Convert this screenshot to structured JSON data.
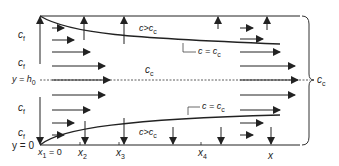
{
  "diagram": {
    "left_labels": {
      "c_f_upper_1": "c",
      "c_f_upper_1_sub": "f",
      "c_f_upper_2": "c",
      "c_f_upper_2_sub": "f",
      "y_h0": "y = h",
      "y_h0_sub": "0",
      "c_f_lower_1": "c",
      "c_f_lower_1_sub": "f",
      "c_f_lower_2": "c",
      "c_f_lower_2_sub": "f",
      "y_0": "y = 0"
    },
    "region_labels": {
      "upper_c_gt_cc": "c>c",
      "upper_c_gt_cc_sub": "c",
      "upper_c_eq_cc": "c = c",
      "upper_c_eq_cc_sub": "c",
      "center_cc": "c",
      "center_cc_sub": "c",
      "lower_c_eq_cc": "c = c",
      "lower_c_eq_cc_sub": "c",
      "lower_c_gt_cc": "c>c",
      "lower_c_gt_cc_sub": "c"
    },
    "x_axis": {
      "x1": "x",
      "x1_sub": "1",
      "x1_suffix": " = 0",
      "x2": "x",
      "x2_sub": "2",
      "x3": "x",
      "x3_sub": "3",
      "x4": "x",
      "x4_sub": "4",
      "x": "x"
    },
    "brace_label": "c",
    "brace_label_sub": "c",
    "colors": {
      "line": "#222222",
      "dashed": "#333333"
    }
  }
}
